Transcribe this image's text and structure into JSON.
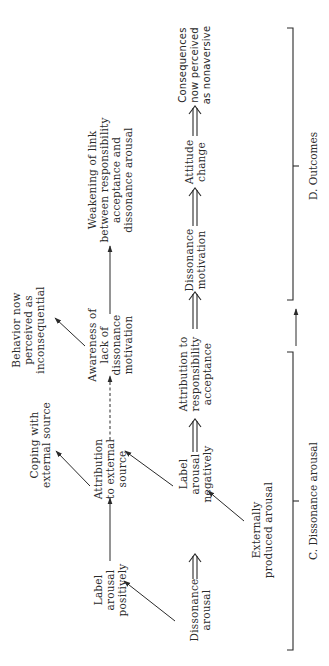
{
  "diagram": {
    "orientation": "rotated 90 degrees counter-clockwise",
    "nodes": {
      "dissonance_arousal": "Dissonance\narousal",
      "label_positive": "Label\narousal\npositively",
      "label_negative": "Label\narousal\nnegatively",
      "externally_produced": "Externally\nproduced arousal",
      "attribution_external": "Attribution\nto external\nsource",
      "coping_external": "Coping with\nexternal source",
      "attribution_responsibility": "Attribution to\nresponsibility\nacceptance",
      "awareness_lack": "Awareness of\nlack of\ndissonance\nmotivation",
      "behavior_inconsequential": "Behavior now\nperceived as\ninconsequential",
      "dissonance_motivation": "Dissonance\nmotivation",
      "weakening_link": "Weakening of link\nbetween responsibility\nacceptance and\ndissonance arousal",
      "attitude_change": "Attitude\nchange",
      "consequences_nonaversive": "Consequences\nnow perceived\nas nonaversive"
    },
    "brackets": {
      "c_label": "C. Dissonance arousal",
      "d_label": "D. Outcomes"
    },
    "colors": {
      "ink": "#2a2a2a",
      "background": "#ffffff"
    }
  }
}
